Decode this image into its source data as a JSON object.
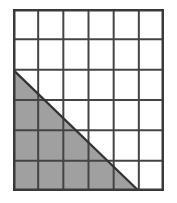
{
  "figure": {
    "type": "geometry-grid-diagram",
    "grid": {
      "columns": 6,
      "rows": 6,
      "cell_width_px": 25.2,
      "cell_height_px": 30.3,
      "origin_x_px": 13,
      "origin_y_px": 9,
      "total_width_px": 151,
      "total_height_px": 182,
      "gridline_color": "#444444",
      "outer_border_color": "#3a3a3a",
      "cell_fill_color": "#ffffff",
      "gridline_width_px": 2,
      "outer_border_width_px": 2.5,
      "grid_visible": true
    },
    "shaded_region": {
      "shape": "right-triangle",
      "fill_color": "#a0a0a0",
      "outline_color": "#333333",
      "description": "Right triangle with the right angle at the bottom-left corner of the grid; vertical leg along the left edge spanning rows 3 through 6, horizontal leg along the bottom edge spanning columns 1 through 5, hypotenuse of slope 1 cell down per 1 cell right.",
      "vertices_in_cell_units": [
        {
          "label": "apex",
          "col": 0,
          "row": 2
        },
        {
          "label": "right-angle",
          "col": 0,
          "row": 6
        },
        {
          "label": "base-end",
          "col": 5,
          "row": 6
        }
      ],
      "legs": {
        "vertical_cells": 4,
        "horizontal_cells": 5
      },
      "area_in_cells": 10,
      "hypotenuse_slope": "-1 cell per cell"
    },
    "shaded_cells_by_row": [
      {
        "row": 1,
        "full": 0,
        "partial": 0
      },
      {
        "row": 2,
        "full": 0,
        "partial": 0
      },
      {
        "row": 3,
        "full": 0,
        "partial": 1
      },
      {
        "row": 4,
        "full": 1,
        "partial": 1
      },
      {
        "row": 5,
        "full": 2,
        "partial": 1
      },
      {
        "row": 6,
        "full": 4,
        "partial": 1
      }
    ]
  }
}
